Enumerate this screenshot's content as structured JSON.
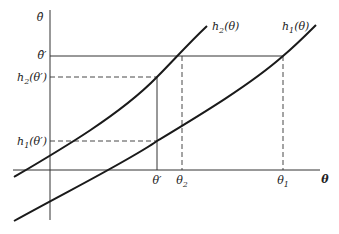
{
  "diagram": {
    "y_axis_label": "θ̂",
    "x_axis_label": "θ",
    "curves": [
      {
        "name": "h2",
        "label_fn": "h",
        "label_sub": "2",
        "label_arg": "(θ)"
      },
      {
        "name": "h1",
        "label_fn": "h",
        "label_sub": "1",
        "label_arg": "(θ)"
      }
    ],
    "y_ticks": [
      {
        "name": "theta-hat-prime",
        "text": "θ̂′"
      },
      {
        "name": "h2-theta-prime",
        "fn": "h",
        "sub": "2",
        "arg": "(θ′)"
      },
      {
        "name": "h1-theta-prime",
        "fn": "h",
        "sub": "1",
        "arg": "(θ′)"
      }
    ],
    "x_ticks": [
      {
        "name": "theta-prime",
        "text": "θ′"
      },
      {
        "name": "theta-2",
        "base": "θ",
        "sub": "2"
      },
      {
        "name": "theta-1",
        "base": "θ",
        "sub": "1"
      }
    ],
    "colors": {
      "line": "#222222",
      "background": "#ffffff"
    }
  }
}
